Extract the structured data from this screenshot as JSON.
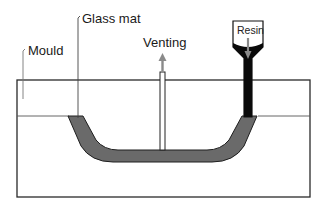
{
  "labels": {
    "mould": "Mould",
    "glass_mat": "Glass mat",
    "venting": "Venting",
    "resin": "Resin"
  },
  "colors": {
    "outline": "#222222",
    "laminate": "#6a6a6a",
    "resin": "#0a0a0a",
    "arrow": "#8a8a8a",
    "leader": "#444444"
  }
}
